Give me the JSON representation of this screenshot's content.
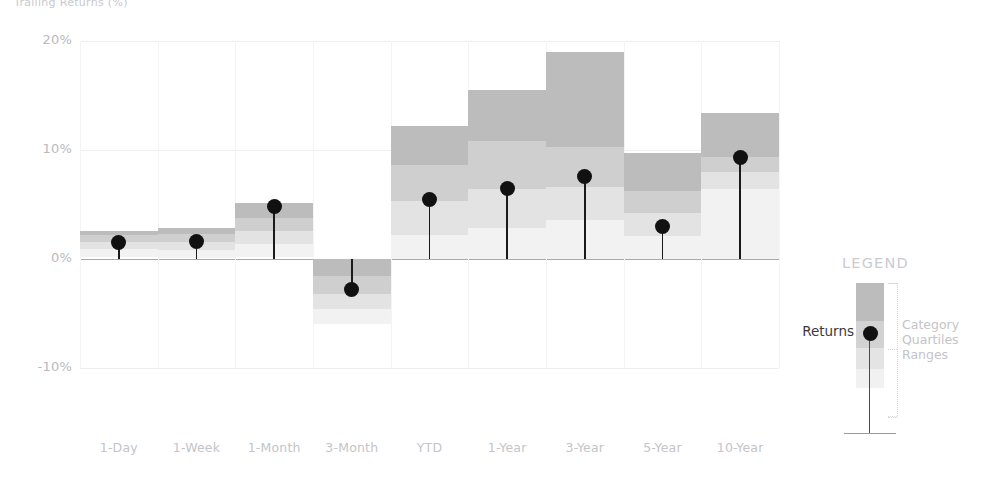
{
  "title": "Trailing Returns (%)",
  "axes": {
    "y_ticks": [
      "20%",
      "10%",
      "0%",
      "-10%"
    ],
    "y_values": [
      20,
      10,
      0,
      -10
    ],
    "ylim": [
      -13,
      21
    ],
    "ylabel": "",
    "xlabel": ""
  },
  "legend": {
    "heading": "LEGEND",
    "returns_label": "Returns",
    "desc_line1": "Category",
    "desc_line2": "Quartiles",
    "desc_line3": "Ranges",
    "band_colors": [
      "#bcbcbc",
      "#d2d2d2",
      "#e4e4e4",
      "#f1f1f1"
    ],
    "marker_color": "#111111"
  },
  "colors": {
    "band_q4_top": "#bcbcbc",
    "band_q3": "#cfcfcf",
    "band_q2": "#e3e3e3",
    "band_q1_bottom": "#f2f2f2",
    "marker": "#111111",
    "zero_axis": "#a9a9ad",
    "gridline": "#eeeef0",
    "tick_text": "#bdbdc2"
  },
  "chart_data": {
    "type": "bar",
    "title": "Trailing Returns (%)",
    "xlabel": "",
    "ylabel": "",
    "ylim": [
      -13,
      21
    ],
    "grid": true,
    "legend_position": "right",
    "categories": [
      "1-Day",
      "1-Week",
      "1-Month",
      "3-Month",
      "YTD",
      "1-Year",
      "3-Year",
      "5-Year",
      "10-Year"
    ],
    "series": [
      {
        "name": "Returns",
        "values": [
          1.5,
          1.6,
          4.8,
          -2.8,
          5.5,
          6.5,
          7.6,
          3.0,
          9.3
        ]
      }
    ],
    "quartile_ranges": {
      "note": "Category quartile ranges: [min, q1, median, q3, max] in percent",
      "1-Day": [
        0.2,
        0.9,
        1.6,
        2.2,
        2.6
      ],
      "1-Week": [
        0.1,
        0.8,
        1.6,
        2.3,
        2.8
      ],
      "1-Month": [
        0.2,
        1.4,
        2.6,
        3.8,
        5.1
      ],
      "3-Month": [
        -6.0,
        -4.6,
        -3.2,
        -1.6,
        0.0
      ],
      "YTD": [
        0.0,
        2.2,
        5.3,
        8.6,
        12.2
      ],
      "1-Year": [
        0.0,
        2.8,
        6.4,
        10.8,
        15.5
      ],
      "3-Year": [
        0.0,
        3.6,
        6.6,
        10.3,
        19.0
      ],
      "5-Year": [
        0.0,
        2.1,
        4.2,
        6.2,
        9.7
      ],
      "10-Year": [
        0.0,
        6.4,
        8.0,
        9.4,
        13.4
      ]
    }
  }
}
